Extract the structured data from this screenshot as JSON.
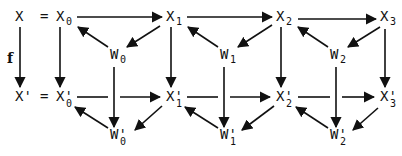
{
  "diagram": {
    "type": "commutative-diagram",
    "map_label": "f",
    "equals": "=",
    "top": {
      "lhs": "X",
      "nodes": [
        {
          "base": "X",
          "sub": "0"
        },
        {
          "base": "X",
          "sub": "1"
        },
        {
          "base": "X",
          "sub": "2"
        },
        {
          "base": "X",
          "sub": "3"
        }
      ],
      "w_nodes": [
        {
          "base": "W",
          "sub": "0"
        },
        {
          "base": "W",
          "sub": "1"
        },
        {
          "base": "W",
          "sub": "2"
        }
      ]
    },
    "bottom": {
      "lhs": "X'",
      "nodes": [
        {
          "base": "X'",
          "sub": "0"
        },
        {
          "base": "X'",
          "sub": "1"
        },
        {
          "base": "X'",
          "sub": "2"
        },
        {
          "base": "X'",
          "sub": "3"
        }
      ],
      "w_nodes": [
        {
          "base": "W'",
          "sub": "0"
        },
        {
          "base": "W'",
          "sub": "1"
        },
        {
          "base": "W'",
          "sub": "2"
        }
      ]
    },
    "edges": [
      "X0→X1",
      "X1→X2",
      "X2→X3",
      "W0→X0",
      "X1→W0",
      "W1→X1",
      "X2→W1",
      "W2→X2",
      "X3→W2",
      "X→X'",
      "X0→X'0",
      "X1→X'1",
      "X2→X'2",
      "X3→X'3",
      "W0→W'0",
      "W1→W'1",
      "W2→W'2",
      "X'0→X'1",
      "X'1→X'2",
      "X'2→X'3",
      "W'0→X'0",
      "X'1→W'0",
      "W'1→X'1",
      "X'2→W'1",
      "W'2→X'2",
      "X'3→W'2"
    ]
  }
}
